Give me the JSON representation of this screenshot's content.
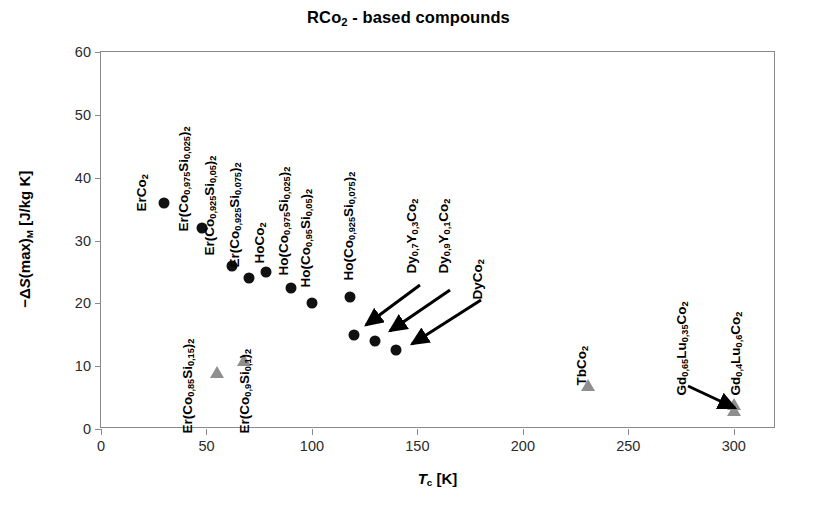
{
  "chart_data": {
    "type": "scatter",
    "title": "RCo2 - based compounds",
    "title_html": "RCo<sub>2</sub> - based compounds",
    "xlabel": "Tc [K]",
    "xlabel_html": "<i>T</i><sub>c</sub> [K]",
    "ylabel": "-ΔS(max)M [J/kg K]",
    "ylabel_html": "−Δ<i>S</i>(max)<sub>M</sub> [J/kg K]",
    "xlim": [
      0,
      320
    ],
    "ylim": [
      0,
      60
    ],
    "xticks": [
      0,
      50,
      100,
      150,
      200,
      250,
      300
    ],
    "yticks": [
      0,
      10,
      20,
      30,
      40,
      50,
      60
    ],
    "grid": false,
    "legend": "none",
    "series": [
      {
        "name": "black-circles",
        "marker": "circle",
        "color": "#111111",
        "points": [
          {
            "label": "ErCo2",
            "label_html": "ErCo<sub>2</sub>",
            "x": 30,
            "y": 36.0,
            "lx": 150,
            "ly": 196,
            "arrow": false
          },
          {
            "label": "Er(Co0,975Si0,025)2",
            "label_html": "Er(Co<sub>0,975</sub>Si<sub>0,025</sub>)<sub>2</sub>",
            "x": 48,
            "y": 32.0,
            "lx": 192,
            "ly": 216,
            "arrow": false
          },
          {
            "label": "Er(Co0,925Si0,05)2",
            "label_html": "Er(Co<sub>0,925</sub>Si<sub>0,05</sub>)<sub>2</sub>",
            "x": 62,
            "y": 26.0,
            "lx": 218,
            "ly": 240,
            "arrow": false
          },
          {
            "label": "Er(Co0,925Si0,075)2",
            "label_html": "Er(Co<sub>0,925</sub>Si<sub>0,075</sub>)<sub>2</sub>",
            "x": 70,
            "y": 24.0,
            "lx": 243,
            "ly": 252,
            "arrow": false
          },
          {
            "label": "HoCo2",
            "label_html": "HoCo<sub>2</sub>",
            "x": 78,
            "y": 25.0,
            "lx": 268,
            "ly": 248,
            "arrow": false
          },
          {
            "label": "Ho(Co0,975Si0,025)2",
            "label_html": "Ho(Co<sub>0,975</sub>Si<sub>0,025</sub>)<sub>2</sub>",
            "x": 90,
            "y": 22.5,
            "lx": 292,
            "ly": 260,
            "arrow": false
          },
          {
            "label": "Ho(Co0,95Si0,05)2",
            "label_html": "Ho(Co<sub>0,95</sub>Si<sub>0,05</sub>)<sub>2</sub>",
            "x": 100,
            "y": 20.0,
            "lx": 314,
            "ly": 272,
            "arrow": false
          },
          {
            "label": "Ho(Co0,925Si0,075)2",
            "label_html": "Ho(Co<sub>0,925</sub>Si<sub>0,075</sub>)<sub>2</sub>",
            "x": 118,
            "y": 21.0,
            "lx": 357,
            "ly": 265,
            "arrow": false
          },
          {
            "label": "Dy0,7Y0,3Co2",
            "label_html": "Dy<sub>0,7</sub>Y<sub>0,3</sub>Co<sub>2</sub>",
            "x": 120,
            "y": 15.0,
            "lx": 420,
            "ly": 258,
            "arrow": true,
            "ax1": 420,
            "ay1": 285,
            "ax2": 366,
            "ay2": 325
          },
          {
            "label": "Dy0,9Y0,1Co2",
            "label_html": "Dy<sub>0,9</sub>Y<sub>0,1</sub>Co<sub>2</sub>",
            "x": 130,
            "y": 14.0,
            "lx": 452,
            "ly": 258,
            "arrow": true,
            "ax1": 450,
            "ay1": 290,
            "ax2": 390,
            "ay2": 331
          },
          {
            "label": "DyCo2",
            "label_html": "DyCo<sub>2</sub>",
            "x": 140,
            "y": 12.5,
            "lx": 486,
            "ly": 284,
            "arrow": true,
            "ax1": 481,
            "ay1": 300,
            "ax2": 412,
            "ay2": 344
          }
        ]
      },
      {
        "name": "gray-triangles",
        "marker": "triangle",
        "color": "#8f8f8f",
        "points": [
          {
            "label": "Er(Co0,85Si0,15)2",
            "label_html": "Er(Co<sub>0,85</sub>Si<sub>0,15</sub>)<sub>2</sub>",
            "x": 55,
            "y": 9.0,
            "lx": 196,
            "ly": 418,
            "arrow": false
          },
          {
            "label": "Er(Co0,9Si0,1)2",
            "label_html": "Er(Co<sub>0,9</sub>Si<sub>0,1</sub>)<sub>2</sub>",
            "x": 68,
            "y": 11.0,
            "lx": 253,
            "ly": 418,
            "arrow": false
          },
          {
            "label": "TbCo2",
            "label_html": "TbCo<sub>2</sub>",
            "x": 231,
            "y": 7.0,
            "lx": 590,
            "ly": 370,
            "arrow": false
          },
          {
            "label": "Gd0,65Lu0,35Co2",
            "label_html": "Gd<sub>0,65</sub>Lu<sub>0,35</sub>Co<sub>2</sub>",
            "x": 300,
            "y": 4.0,
            "lx": 690,
            "ly": 380,
            "arrow": true,
            "ax1": 688,
            "ay1": 386,
            "ax2": 735,
            "ay2": 408
          },
          {
            "label": "Gd0,4Lu0,6Co2",
            "label_html": "Gd<sub>0,4</sub>Lu<sub>0,6</sub>Co<sub>2</sub>",
            "x": 300,
            "y": 3.0,
            "lx": 744,
            "ly": 380,
            "arrow": false
          }
        ]
      }
    ]
  }
}
